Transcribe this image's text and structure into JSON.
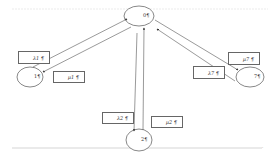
{
  "diagram": {
    "type": "state-transition",
    "colors": {
      "line": "#555555",
      "box_border": "#666666",
      "rule": "#cccccc",
      "text": "#333333"
    },
    "nodes": [
      {
        "id": "0",
        "label": "0¶",
        "cx": 139,
        "cy": 16,
        "rx": 15,
        "ry": 10
      },
      {
        "id": "1",
        "label": "1¶",
        "cx": 30,
        "cy": 77,
        "rx": 13,
        "ry": 10
      },
      {
        "id": "2",
        "label": "2¶",
        "cx": 139,
        "cy": 140,
        "rx": 13,
        "ry": 11
      },
      {
        "id": "7",
        "label": "7¶",
        "cx": 250,
        "cy": 77,
        "rx": 14,
        "ry": 10
      }
    ],
    "edges": [
      {
        "from": "1",
        "to": "0",
        "rate_label": "λ1¶"
      },
      {
        "from": "0",
        "to": "1",
        "rate_label": "μ1¶"
      },
      {
        "from": "0",
        "to": "2",
        "rate_label": "λ2¶"
      },
      {
        "from": "2",
        "to": "0",
        "rate_label": "μ2¶"
      },
      {
        "from": "7",
        "to": "0",
        "rate_label": "λ7¶"
      },
      {
        "from": "0",
        "to": "7",
        "rate_label": "μ7¶"
      }
    ],
    "rate_boxes": {
      "lambda1": "λ1 ¶",
      "mu1": "μ1 ¶",
      "lambda2": "λ2 ¶",
      "mu2": "μ2 ¶",
      "lambda7": "λ7 ¶",
      "mu7": "μ7 ¶"
    },
    "node_labels": {
      "n0": "0¶",
      "n1": "1¶",
      "n2": "2¶",
      "n7": "7¶"
    },
    "end_mark": "¶"
  }
}
